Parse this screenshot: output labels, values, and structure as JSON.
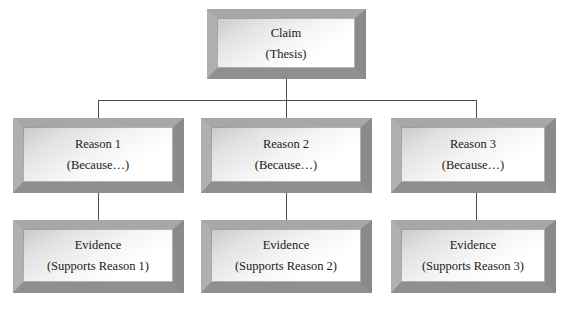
{
  "diagram": {
    "background_color": "#ffffff",
    "box_bevel_color": "#9a9a9a",
    "box_face_color": "#ffffff",
    "connector_color": "#4c4c4c",
    "text_color": "#1a1a1a"
  },
  "nodes": {
    "claim": {
      "line1": "Claim",
      "line2": "(Thesis)"
    },
    "reason1": {
      "line1": "Reason 1",
      "line2": "(Because…)"
    },
    "reason2": {
      "line1": "Reason 2",
      "line2": "(Because…)"
    },
    "reason3": {
      "line1": "Reason 3",
      "line2": "(Because…)"
    },
    "evidence1": {
      "line1": "Evidence",
      "line2": "(Supports Reason 1)"
    },
    "evidence2": {
      "line1": "Evidence",
      "line2": "(Supports Reason 2)"
    },
    "evidence3": {
      "line1": "Evidence",
      "line2": "(Supports Reason 3)"
    }
  },
  "connectors": [
    {
      "name": "claim-to-bus",
      "type": "vertical"
    },
    {
      "name": "bus-horizontal",
      "type": "horizontal"
    },
    {
      "name": "bus-to-reason1",
      "type": "vertical"
    },
    {
      "name": "bus-to-reason2",
      "type": "vertical"
    },
    {
      "name": "bus-to-reason3",
      "type": "vertical"
    },
    {
      "name": "reason1-to-evidence1",
      "type": "vertical"
    },
    {
      "name": "reason2-to-evidence2",
      "type": "vertical"
    },
    {
      "name": "reason3-to-evidence3",
      "type": "vertical"
    }
  ]
}
